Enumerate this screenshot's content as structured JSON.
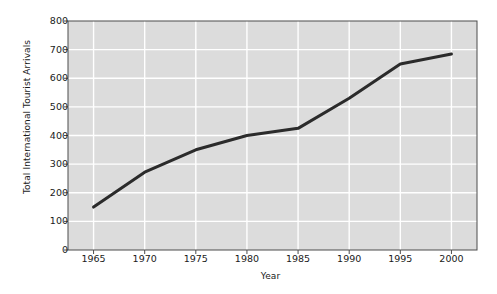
{
  "chart_data": {
    "type": "line",
    "title": "",
    "xlabel": "Year",
    "ylabel": "Total International Tourist Arrivals",
    "x": [
      1965,
      1970,
      1975,
      1980,
      1985,
      1990,
      1995,
      2000
    ],
    "values": [
      150,
      272,
      350,
      400,
      425,
      530,
      650,
      685
    ],
    "series": [
      {
        "name": "Total International Tourist Arrivals",
        "values": [
          150,
          272,
          350,
          400,
          425,
          530,
          650,
          685
        ]
      }
    ],
    "xlim": [
      1962.5,
      2002.5
    ],
    "ylim": [
      0,
      800
    ],
    "xticks": [
      1965,
      1970,
      1975,
      1980,
      1985,
      1990,
      1995,
      2000
    ],
    "xtick_labels": [
      "1965",
      "1970",
      "1975",
      "1980",
      "1985",
      "1990",
      "1995",
      "2000"
    ],
    "yticks": [
      0,
      100,
      200,
      300,
      400,
      500,
      600,
      700,
      800
    ],
    "ytick_labels": [
      "0",
      "100",
      "200",
      "300",
      "400",
      "500",
      "600",
      "700",
      "800"
    ],
    "grid": true,
    "grid_color": "#ffffff",
    "plot_bg_color": "#dcdcdc",
    "line_color": "#2b2b2b",
    "line_width": 3,
    "legend": null,
    "legend_position": "none",
    "figure_bg_color": "#ffffff",
    "axis_color": "#4d4d4d"
  }
}
